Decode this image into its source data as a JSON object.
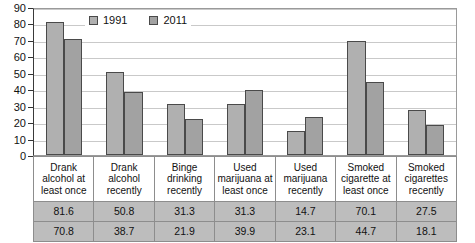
{
  "chart_data": {
    "type": "bar",
    "title": "",
    "subtitle": "",
    "xlabel": "",
    "ylabel": "",
    "ylim": [
      0,
      90
    ],
    "yticks": [
      0,
      10,
      20,
      30,
      40,
      50,
      60,
      70,
      80,
      90
    ],
    "grid": true,
    "legend_position": "top-center",
    "categories": [
      "Drank alcohol at least once",
      "Drank alcohol recently",
      "Binge drinking recently",
      "Used marijuana at least once",
      "Used marijuana recently",
      "Smoked cigarette at least once",
      "Smoked cigarettes recently"
    ],
    "series": [
      {
        "name": "1991",
        "color": "#b0b0b0",
        "values": [
          81.6,
          50.8,
          31.3,
          31.3,
          14.7,
          70.1,
          27.5
        ]
      },
      {
        "name": "2011",
        "color": "#a2a2a2",
        "values": [
          70.8,
          38.7,
          21.9,
          39.9,
          23.1,
          44.7,
          18.1
        ]
      }
    ]
  },
  "legend": {
    "entries": [
      {
        "label": "1991"
      },
      {
        "label": "2011"
      }
    ]
  },
  "axis": {
    "y_tick_labels": [
      "90",
      "80",
      "70",
      "60",
      "50",
      "40",
      "30",
      "20",
      "10",
      "0"
    ]
  },
  "table": {
    "header_cells": [
      "Drank alcohol at least once",
      "Drank alcohol recently",
      "Binge drinking recently",
      "Used marijuana at least once",
      "Used marijuana recently",
      "Smoked cigarette at least once",
      "Smoked cigarettes recently"
    ],
    "rows": [
      {
        "series": "1991",
        "cells": [
          "81.6",
          "50.8",
          "31.3",
          "31.3",
          "14.7",
          "70.1",
          "27.5"
        ]
      },
      {
        "series": "2011",
        "cells": [
          "70.8",
          "38.7",
          "21.9",
          "39.9",
          "23.1",
          "44.7",
          "18.1"
        ]
      }
    ]
  }
}
